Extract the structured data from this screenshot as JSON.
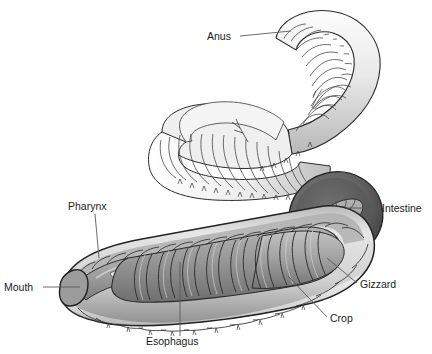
{
  "figure": {
    "background_color": "#ffffff",
    "label_color": "#1c1c1c",
    "leader_color": "#5a5a5a",
    "outline_color": "#2b2b2b"
  },
  "labels": [
    {
      "id": "anus",
      "text": "Anus",
      "x": 207,
      "y": 40,
      "anchor": "start"
    },
    {
      "id": "pharynx",
      "text": "Pharynx",
      "x": 68,
      "y": 210,
      "anchor": "start"
    },
    {
      "id": "mouth",
      "text": "Mouth",
      "x": 4,
      "y": 291,
      "anchor": "start"
    },
    {
      "id": "esophagus",
      "text": "Esophagus",
      "x": 146,
      "y": 345,
      "anchor": "start"
    },
    {
      "id": "crop",
      "text": "Crop",
      "x": 330,
      "y": 322,
      "anchor": "start"
    },
    {
      "id": "gizzard",
      "text": "Gizzard",
      "x": 360,
      "y": 288,
      "anchor": "start"
    },
    {
      "id": "intestine",
      "text": "Intestine",
      "x": 382,
      "y": 212,
      "anchor": "start"
    }
  ],
  "leaders": [
    {
      "id": "anus-leader",
      "d": "M 240 36 L 291 31"
    },
    {
      "id": "pharynx-leader",
      "d": "M 95 214 L 99 258"
    },
    {
      "id": "mouth-leader",
      "d": "M 43 287 L 80 287"
    },
    {
      "id": "esophagus-leader",
      "d": "M 180 336 L 180 262"
    },
    {
      "id": "crop-leader",
      "d": "M 327 317 L 288 276"
    },
    {
      "id": "gizzard-leader",
      "d": "M 357 283 L 327 258"
    },
    {
      "id": "intestine-leader",
      "d": "M 379 208 L 345 208"
    }
  ],
  "colors": {
    "body_light": "#e2e2e2",
    "body_mid": "#c6c6c6",
    "body_shadow": "#9a9a9a",
    "gut_grey": "#9d9d9d",
    "gut_dark": "#7a7a7a",
    "cavity_dark": "#4a4a4a",
    "outline": "#2b2b2b",
    "hairline": "#555555"
  }
}
